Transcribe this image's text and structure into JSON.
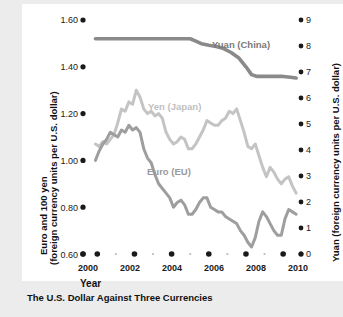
{
  "caption": "The U.S. Dollar Against Three Currencies",
  "axes": {
    "x_title": "Year",
    "left_title_line1": "Euro and 100 yen",
    "left_title_line2": "(foreign currency units per U.S. dollar)",
    "right_title": "Yuan (foreign currency units per U.S. dollar)",
    "left_ticks": [
      "1.60",
      "1.40",
      "1.20",
      "1.00",
      "0.80",
      "0.60"
    ],
    "right_ticks": [
      "9",
      "8",
      "7",
      "6",
      "5",
      "4",
      "3",
      "2",
      "1",
      "0"
    ],
    "x_ticks": [
      "2000",
      "2002",
      "2004",
      "2006",
      "2008",
      "2010"
    ]
  },
  "series_labels": {
    "yuan": "Yuan (China)",
    "yen": "Yen (Japan)",
    "euro": "Euro (EU)"
  },
  "colors": {
    "yuan": "#8a8a8a",
    "yen": "#c4c4c4",
    "euro": "#9e9e9e",
    "text": "#1a1a1a",
    "card": "#ffffff",
    "page": "#ececec"
  },
  "chart_data": {
    "type": "line",
    "title": "The U.S. Dollar Against Three Currencies",
    "xlabel": "Year",
    "ylabel": "Euro and 100 yen (foreign currency units per U.S. dollar)",
    "y2label": "Yuan (foreign currency units per U.S. dollar)",
    "xlim": [
      1999.5,
      2010.8
    ],
    "ylim": [
      0.6,
      1.6
    ],
    "y2lim": [
      0,
      9
    ],
    "grid": false,
    "legend": "inline-labels",
    "xticks": [
      2000,
      2002,
      2004,
      2006,
      2008,
      2010
    ],
    "xminor": [
      2001,
      2003,
      2005,
      2007,
      2009
    ],
    "yticks": [
      0.6,
      0.8,
      1.0,
      1.2,
      1.4,
      1.6
    ],
    "y2ticks": [
      0,
      1,
      2,
      3,
      4,
      5,
      6,
      7,
      8,
      9
    ],
    "series": [
      {
        "name": "Yuan (China)",
        "axis": "right",
        "units": "yuan per U.S. dollar",
        "x": [
          1999.9,
          2000.5,
          2001.0,
          2001.5,
          2002.0,
          2002.5,
          2003.0,
          2003.5,
          2004.0,
          2004.5,
          2005.0,
          2005.3,
          2005.6,
          2006.0,
          2006.4,
          2006.8,
          2007.2,
          2007.6,
          2008.0,
          2008.3,
          2008.6,
          2009.0,
          2009.5,
          2010.0,
          2010.4,
          2010.7
        ],
        "values": [
          8.28,
          8.28,
          8.28,
          8.28,
          8.28,
          8.28,
          8.28,
          8.28,
          8.28,
          8.28,
          8.28,
          8.19,
          8.09,
          8.03,
          7.98,
          7.9,
          7.75,
          7.55,
          7.2,
          6.9,
          6.83,
          6.83,
          6.83,
          6.83,
          6.8,
          6.77
        ]
      },
      {
        "name": "Yen (Japan)",
        "axis": "left",
        "units": "100 yen per U.S. dollar",
        "x": [
          1999.9,
          2000.1,
          2000.3,
          2000.5,
          2000.7,
          2000.9,
          2001.1,
          2001.3,
          2001.5,
          2001.7,
          2001.9,
          2002.1,
          2002.3,
          2002.5,
          2002.7,
          2002.9,
          2003.1,
          2003.3,
          2003.5,
          2003.7,
          2003.9,
          2004.1,
          2004.3,
          2004.5,
          2004.7,
          2004.9,
          2005.1,
          2005.3,
          2005.5,
          2005.7,
          2005.9,
          2006.1,
          2006.3,
          2006.5,
          2006.7,
          2006.9,
          2007.1,
          2007.3,
          2007.5,
          2007.7,
          2007.9,
          2008.1,
          2008.3,
          2008.5,
          2008.7,
          2008.9,
          2009.1,
          2009.3,
          2009.5,
          2009.7,
          2009.9,
          2010.1,
          2010.3,
          2010.5,
          2010.7
        ],
        "values": [
          1.07,
          1.06,
          1.08,
          1.07,
          1.09,
          1.11,
          1.16,
          1.22,
          1.21,
          1.25,
          1.24,
          1.3,
          1.27,
          1.22,
          1.2,
          1.21,
          1.19,
          1.2,
          1.18,
          1.12,
          1.09,
          1.07,
          1.08,
          1.1,
          1.09,
          1.05,
          1.05,
          1.07,
          1.1,
          1.13,
          1.17,
          1.16,
          1.15,
          1.15,
          1.17,
          1.18,
          1.21,
          1.2,
          1.22,
          1.17,
          1.12,
          1.06,
          1.05,
          1.07,
          1.02,
          0.97,
          0.93,
          0.97,
          0.95,
          0.92,
          0.9,
          0.92,
          0.93,
          0.89,
          0.86
        ]
      },
      {
        "name": "Euro (EU)",
        "axis": "left",
        "units": "euro per U.S. dollar",
        "x": [
          1999.9,
          2000.1,
          2000.3,
          2000.5,
          2000.7,
          2000.9,
          2001.1,
          2001.3,
          2001.5,
          2001.7,
          2001.9,
          2002.1,
          2002.3,
          2002.5,
          2002.7,
          2002.9,
          2003.1,
          2003.3,
          2003.5,
          2003.7,
          2003.9,
          2004.1,
          2004.3,
          2004.5,
          2004.7,
          2004.9,
          2005.1,
          2005.3,
          2005.5,
          2005.7,
          2005.9,
          2006.1,
          2006.3,
          2006.5,
          2006.7,
          2006.9,
          2007.1,
          2007.3,
          2007.5,
          2007.7,
          2007.9,
          2008.1,
          2008.3,
          2008.5,
          2008.7,
          2008.9,
          2009.1,
          2009.3,
          2009.5,
          2009.7,
          2009.9,
          2010.1,
          2010.3,
          2010.5,
          2010.7
        ],
        "values": [
          1.0,
          1.04,
          1.07,
          1.09,
          1.12,
          1.11,
          1.1,
          1.13,
          1.12,
          1.15,
          1.13,
          1.14,
          1.12,
          1.05,
          1.01,
          0.99,
          0.94,
          0.9,
          0.88,
          0.86,
          0.84,
          0.8,
          0.82,
          0.83,
          0.81,
          0.77,
          0.77,
          0.79,
          0.82,
          0.84,
          0.84,
          0.8,
          0.79,
          0.78,
          0.78,
          0.76,
          0.75,
          0.74,
          0.73,
          0.7,
          0.68,
          0.65,
          0.63,
          0.67,
          0.74,
          0.78,
          0.76,
          0.73,
          0.7,
          0.68,
          0.68,
          0.75,
          0.79,
          0.78,
          0.77
        ]
      }
    ]
  }
}
